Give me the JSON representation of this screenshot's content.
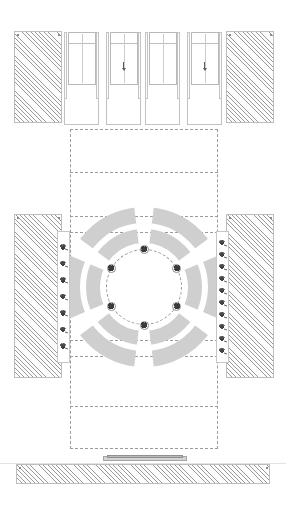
{
  "drawing": {
    "type": "architectural-floor-plan",
    "title": "Plaza / Rotunda Floor Plan",
    "width": 286,
    "height": 507,
    "background_color": "#ffffff",
    "line_color": "#b4b4b4",
    "dash_color": "#9b9b9b",
    "hatch_color": "#9a9a9a",
    "symbol_color": "#3a3a3a"
  },
  "walls": {
    "label": "hatched-masonry-walls",
    "hatch_angle_deg": 45,
    "blocks": [
      {
        "name": "wall-top-left",
        "x": 14,
        "y": 31,
        "w": 48,
        "h": 92
      },
      {
        "name": "wall-top-right",
        "x": 226,
        "y": 31,
        "w": 48,
        "h": 92
      },
      {
        "name": "wall-middle-left",
        "x": 14,
        "y": 214,
        "w": 48,
        "h": 164
      },
      {
        "name": "wall-middle-right",
        "x": 226,
        "y": 214,
        "w": 48,
        "h": 164
      },
      {
        "name": "wall-bottom-sill",
        "x": 16,
        "y": 464,
        "w": 254,
        "h": 20
      }
    ]
  },
  "stairs": {
    "label": "stair-runs",
    "tread_count": 6,
    "units": [
      {
        "name": "stair-unit-1",
        "x": 64,
        "y": 32,
        "w": 35,
        "has_direction_arrow": false
      },
      {
        "name": "stair-unit-2",
        "x": 106,
        "y": 32,
        "w": 35,
        "has_direction_arrow": true
      },
      {
        "name": "stair-unit-3",
        "x": 145,
        "y": 32,
        "w": 35,
        "has_direction_arrow": false
      },
      {
        "name": "stair-unit-4",
        "x": 187,
        "y": 32,
        "w": 35,
        "has_direction_arrow": true
      }
    ],
    "flight_height": 53,
    "landing_height": 40,
    "direction_label": "down"
  },
  "grid": {
    "label": "dashed-layout-grid",
    "outer_rect": {
      "x": 70,
      "y": 129,
      "w": 148,
      "h": 320
    },
    "horizontal_lines_y": [
      172,
      216,
      232,
      340,
      356,
      406
    ],
    "vertical_lines_x": []
  },
  "rotunda": {
    "label": "central-rotunda",
    "center_x": 144,
    "center_y": 287,
    "inner_circle_radius": 38,
    "inner_circle_style": "dashed",
    "inner_ring": {
      "name": "inner-arc-ring",
      "inner_radius": 44,
      "outer_radius": 58,
      "segment_count": 6
    },
    "outer_ring": {
      "name": "outer-arc-ring",
      "inner_radius": 64,
      "outer_radius": 80,
      "segment_count": 6
    },
    "trees": {
      "name": "rotunda-tree-ring",
      "count": 6,
      "radius": 38,
      "angles_deg": [
        270,
        330,
        30,
        90,
        150,
        210
      ]
    }
  },
  "planting_strips": {
    "label": "side-planting-strips",
    "left": {
      "name": "strip-left",
      "x": 57,
      "y": 231,
      "w": 13,
      "h": 132,
      "tree_count": 7
    },
    "right": {
      "name": "strip-right",
      "x": 216,
      "y": 231,
      "w": 13,
      "h": 132,
      "tree_count": 10
    }
  },
  "entry": {
    "label": "bottom-entry-step",
    "outer": {
      "x": 103,
      "y": 456,
      "w": 84,
      "h": 5
    },
    "inner": {
      "x": 107,
      "y": 455,
      "w": 76,
      "h": 3
    }
  },
  "baseline": {
    "label": "ground-reference-line",
    "y": 463
  }
}
